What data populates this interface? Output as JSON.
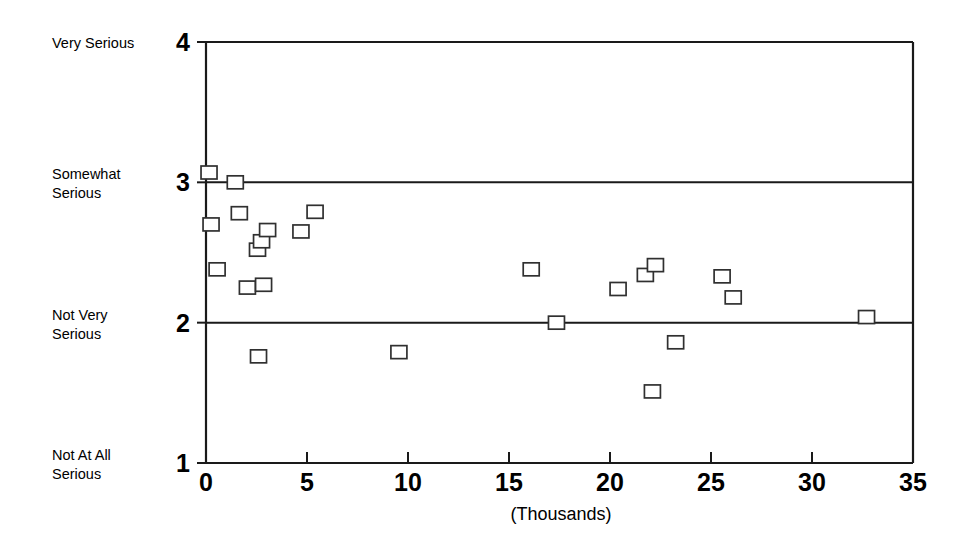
{
  "chart_data": {
    "type": "scatter",
    "title": "",
    "subtitle": "",
    "xlabel": "(Thousands)",
    "ylabel": "",
    "xlim": [
      0,
      35
    ],
    "ylim": [
      1,
      4
    ],
    "grid": "horizontal-at-y2-and-y3",
    "legend": "none",
    "marker_style": "open-square",
    "x_ticks": [
      0,
      5,
      10,
      15,
      20,
      25,
      30,
      35
    ],
    "x_tick_labels": [
      "0",
      "5",
      "10",
      "15",
      "20",
      "25",
      "30",
      "35"
    ],
    "y_ticks": [
      1,
      2,
      3,
      4
    ],
    "y_tick_labels": [
      "1",
      "2",
      "3",
      "4"
    ],
    "y_category_labels": [
      {
        "value": 4,
        "line1": "Very Serious",
        "line2": ""
      },
      {
        "value": 3,
        "line1": "Somewhat",
        "line2": "Serious"
      },
      {
        "value": 2,
        "line1": "Not Very",
        "line2": "Serious"
      },
      {
        "value": 1,
        "line1": "Not At All",
        "line2": "Serious"
      }
    ],
    "points": [
      {
        "x": 0.15,
        "y": 3.07
      },
      {
        "x": 0.25,
        "y": 2.7
      },
      {
        "x": 0.55,
        "y": 2.38
      },
      {
        "x": 1.45,
        "y": 3.0
      },
      {
        "x": 1.65,
        "y": 2.78
      },
      {
        "x": 2.05,
        "y": 2.25
      },
      {
        "x": 2.55,
        "y": 2.52
      },
      {
        "x": 2.6,
        "y": 1.76
      },
      {
        "x": 2.75,
        "y": 2.58
      },
      {
        "x": 2.85,
        "y": 2.27
      },
      {
        "x": 3.05,
        "y": 2.66
      },
      {
        "x": 4.7,
        "y": 2.65
      },
      {
        "x": 5.4,
        "y": 2.79
      },
      {
        "x": 9.55,
        "y": 1.79
      },
      {
        "x": 16.1,
        "y": 2.38
      },
      {
        "x": 17.35,
        "y": 2.0
      },
      {
        "x": 20.4,
        "y": 2.24
      },
      {
        "x": 21.75,
        "y": 2.34
      },
      {
        "x": 22.1,
        "y": 1.51
      },
      {
        "x": 22.25,
        "y": 2.41
      },
      {
        "x": 23.25,
        "y": 1.86
      },
      {
        "x": 25.55,
        "y": 2.33
      },
      {
        "x": 26.1,
        "y": 2.18
      },
      {
        "x": 32.7,
        "y": 2.04
      }
    ]
  },
  "colors": {
    "axis": "#1a1a1a",
    "marker_stroke": "#303030",
    "marker_fill": "#ffffff",
    "background": "#ffffff"
  }
}
